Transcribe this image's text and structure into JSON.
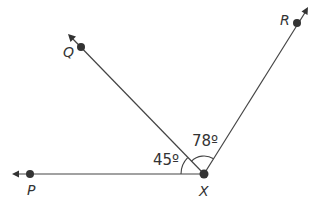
{
  "diagram": {
    "type": "angles",
    "vertex": {
      "label": "X",
      "x": 204,
      "y": 174
    },
    "rays": [
      {
        "name": "XP",
        "label": "P",
        "point": {
          "x": 30,
          "y": 174
        },
        "arrow_tip": {
          "x": 13,
          "y": 174
        },
        "label_pos": {
          "x": 27,
          "y": 195
        }
      },
      {
        "name": "XQ",
        "label": "Q",
        "point": {
          "x": 81,
          "y": 47
        },
        "arrow_tip": {
          "x": 69,
          "y": 35
        },
        "label_pos": {
          "x": 63,
          "y": 57
        }
      },
      {
        "name": "XR",
        "label": "R",
        "point": {
          "x": 297,
          "y": 23
        },
        "arrow_tip": {
          "x": 307,
          "y": 8
        },
        "label_pos": {
          "x": 280,
          "y": 25
        }
      }
    ],
    "angles": [
      {
        "name": "angle-PXQ",
        "label": "45º",
        "between": [
          "XP",
          "XQ"
        ],
        "label_pos": {
          "x": 153,
          "y": 165
        }
      },
      {
        "name": "angle-QXR",
        "label": "78º",
        "between": [
          "XQ",
          "XR"
        ],
        "label_pos": {
          "x": 192,
          "y": 146
        }
      }
    ],
    "labels": {
      "X": "X",
      "P": "P",
      "Q": "Q",
      "R": "R",
      "angle_PXQ": "45º",
      "angle_QXR": "78º"
    },
    "colors": {
      "line": "#444444",
      "point": "#333333",
      "text": "#333333",
      "background": "#ffffff"
    }
  }
}
